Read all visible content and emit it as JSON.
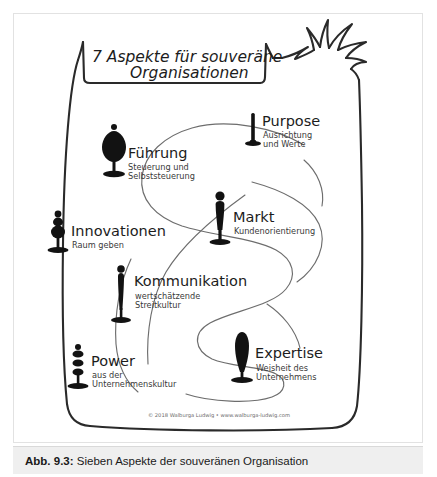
{
  "figure": {
    "title": "7 Aspekte für souveräne",
    "title_line2": "Organisationen",
    "copyright": "© 2018 Walburga Ludwig • www.walburga-ludwig.com",
    "accent_color": "#2a2a2a",
    "ink_color": "#1c1c1c",
    "line_color": "#6d6d6d",
    "background_color": "#ffffff",
    "aspects": [
      {
        "id": "purpose",
        "label": "Purpose",
        "sub_line1": "Ausrichtung",
        "sub_line2": "und Werte",
        "icon": "pin-figure-icon"
      },
      {
        "id": "fuehrung",
        "label": "Führung",
        "sub_line1": "Steuerung und",
        "sub_line2": "Selbststeuerung",
        "icon": "leaf-figure-icon"
      },
      {
        "id": "markt",
        "label": "Markt",
        "sub_line1": "Kundenorientierung",
        "sub_line2": "",
        "icon": "bust-figure-icon"
      },
      {
        "id": "innovationen",
        "label": "Innovationen",
        "sub_line1": "Raum geben",
        "sub_line2": "",
        "icon": "beaded-figure-icon"
      },
      {
        "id": "kommunikation",
        "label": "Kommunikation",
        "sub_line1": "wertschätzende",
        "sub_line2": "Streitkultur",
        "icon": "slim-figure-icon"
      },
      {
        "id": "expertise",
        "label": "Expertise",
        "sub_line1": "Weisheit des",
        "sub_line2": "Unternehmens",
        "icon": "cone-figure-icon"
      },
      {
        "id": "power",
        "label": "Power",
        "sub_line1": "aus der",
        "sub_line2": "Unternehmenskultur",
        "icon": "stacked-figure-icon"
      }
    ]
  },
  "caption": {
    "label": "Abb. 9.3:",
    "text": " Sieben Aspekte der souveränen Organisation"
  }
}
